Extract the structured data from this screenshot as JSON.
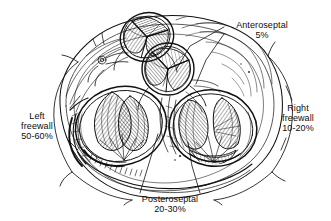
{
  "figure": {
    "background_color": "#ffffff",
    "ink_color": "#111111",
    "width": 331,
    "height": 221
  },
  "labels": {
    "anteroseptal": {
      "name": "Anteroseptal",
      "value": "5%"
    },
    "right_freewall": {
      "line1": "Right",
      "line2": "freewall",
      "value": "10-20%"
    },
    "left_freewall": {
      "line1": "Left",
      "line2": "freewall",
      "value": "50-60%"
    },
    "posteroseptal": {
      "name": "Posteroseptal",
      "value": "20-30%"
    }
  },
  "illustration": {
    "description": "Pen-and-ink anatomical drawing of the base of the heart viewed from above, showing the fibrous skeleton with the mitral valve, tricuspid valve, aortic valve and pulmonary valve, annotated with accessory pathway location percentages.",
    "structures": [
      "pulmonary-valve",
      "aortic-valve",
      "mitral-valve",
      "tricuspid-valve",
      "coronary-sinus",
      "atrial-wall"
    ]
  }
}
